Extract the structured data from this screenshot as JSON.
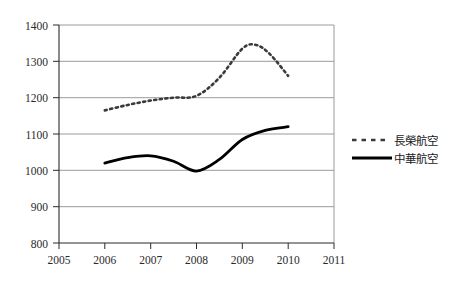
{
  "chart_data": {
    "type": "line",
    "title": "",
    "xlabel": "",
    "ylabel": "",
    "xlim": [
      2005,
      2011
    ],
    "ylim": [
      800,
      1400
    ],
    "grid": true,
    "legend_position": "right",
    "x_ticks": [
      "2005",
      "2006",
      "2007",
      "2008",
      "2009",
      "2010",
      "2011"
    ],
    "y_ticks": [
      "800",
      "900",
      "1000",
      "1100",
      "1200",
      "1300",
      "1400"
    ],
    "series": [
      {
        "name": "長榮航空",
        "style": "dashed",
        "color": "#3a3a3a",
        "x": [
          2006,
          2006.5,
          2007,
          2007.5,
          2008,
          2008.5,
          2009,
          2009.3,
          2009.6,
          2010
        ],
        "values": [
          1165,
          1180,
          1192,
          1200,
          1205,
          1255,
          1335,
          1345,
          1320,
          1260
        ]
      },
      {
        "name": "中華航空",
        "style": "solid",
        "color": "#000000",
        "x": [
          2006,
          2006.5,
          2007,
          2007.5,
          2008,
          2008.5,
          2009,
          2009.5,
          2010
        ],
        "values": [
          1020,
          1035,
          1040,
          1025,
          998,
          1030,
          1085,
          1110,
          1120
        ]
      }
    ]
  },
  "legend": {
    "entries": [
      {
        "label": "長榮航空",
        "marker": "dashed-line-swatch"
      },
      {
        "label": "中華航空",
        "marker": "solid-line-swatch"
      }
    ]
  }
}
